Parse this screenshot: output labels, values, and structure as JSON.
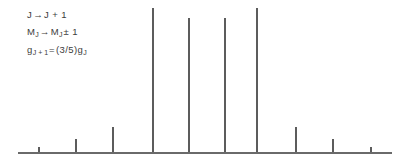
{
  "figure": {
    "width": 420,
    "height": 162,
    "background_color": "#ffffff",
    "line_color": "#5c5c5c",
    "baseline_color": "#6a6a6a",
    "text_color": "#3c3c3c"
  },
  "annotations": {
    "line1": {
      "initial_state": "J",
      "arrow": "→",
      "final_state": "J + 1",
      "full_text": "J → J + 1"
    },
    "line2": {
      "initial_state": "M",
      "initial_sub": "J",
      "arrow": "→",
      "final_state": "M",
      "final_sub": "J",
      "delta": "± 1",
      "full_text": "M_J → M_J ± 1"
    },
    "line3": {
      "lhs": "g",
      "lhs_sub": "J + 1",
      "equals": "=",
      "factor": "(3/5)",
      "rhs": "g",
      "rhs_sub": "J",
      "full_text": "g_J+1 = (3/5)g_J"
    }
  },
  "chart_data": {
    "type": "bar",
    "title": "",
    "subtitle": "",
    "xlabel": "",
    "ylabel": "",
    "grid": false,
    "legend": null,
    "axis": {
      "baseline_y_px": 152,
      "baseline_x_start_px": 18,
      "baseline_x_end_px": 392,
      "plot_top_px": 8,
      "max_line_height_px": 144
    },
    "ylim": [
      0,
      100
    ],
    "x": [
      38,
      75,
      112,
      152,
      188,
      224,
      256,
      295,
      332,
      370
    ],
    "categories": [
      "1",
      "2",
      "3",
      "4",
      "5",
      "6",
      "7",
      "8",
      "9",
      "10"
    ],
    "values": [
      4,
      10,
      26,
      100,
      93,
      93,
      100,
      26,
      10,
      4
    ],
    "series": [
      {
        "name": "transition intensity",
        "values": [
          4,
          10,
          26,
          100,
          93,
          93,
          100,
          26,
          10,
          4
        ]
      }
    ],
    "lines": [
      {
        "id": "line-1",
        "x_px": 38,
        "top_px": 147,
        "height_px": 5,
        "relative_intensity": 4
      },
      {
        "id": "line-2",
        "x_px": 75,
        "top_px": 139,
        "height_px": 13,
        "relative_intensity": 10
      },
      {
        "id": "line-3",
        "x_px": 112,
        "top_px": 127,
        "height_px": 25,
        "relative_intensity": 26
      },
      {
        "id": "line-4",
        "x_px": 152,
        "top_px": 8,
        "height_px": 144,
        "relative_intensity": 100
      },
      {
        "id": "line-5",
        "x_px": 188,
        "top_px": 18,
        "height_px": 134,
        "relative_intensity": 93
      },
      {
        "id": "line-6",
        "x_px": 224,
        "top_px": 18,
        "height_px": 134,
        "relative_intensity": 93
      },
      {
        "id": "line-7",
        "x_px": 256,
        "top_px": 8,
        "height_px": 144,
        "relative_intensity": 100
      },
      {
        "id": "line-8",
        "x_px": 295,
        "top_px": 127,
        "height_px": 25,
        "relative_intensity": 26
      },
      {
        "id": "line-9",
        "x_px": 332,
        "top_px": 139,
        "height_px": 13,
        "relative_intensity": 10
      },
      {
        "id": "line-10",
        "x_px": 370,
        "top_px": 147,
        "height_px": 5,
        "relative_intensity": 4
      }
    ]
  }
}
